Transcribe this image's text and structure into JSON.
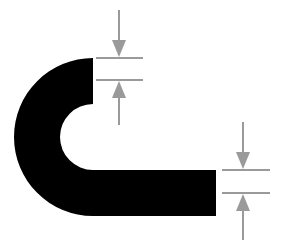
{
  "diagram": {
    "title": "",
    "colors": {
      "shape": "#000000",
      "dimension": "#9a9a9a",
      "background": "#ffffff"
    },
    "elements": [
      {
        "id": "bent-strip",
        "type": "shape",
        "label": ""
      },
      {
        "id": "top-thickness-dimension",
        "type": "dimension",
        "label": ""
      },
      {
        "id": "bottom-thickness-dimension",
        "type": "dimension",
        "label": ""
      }
    ]
  }
}
